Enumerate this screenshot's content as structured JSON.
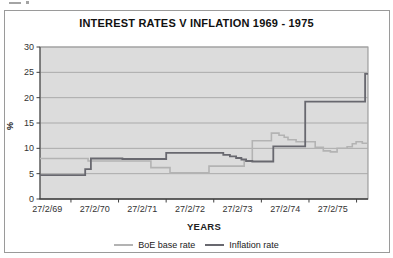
{
  "chart_data": {
    "type": "line",
    "title": "INTEREST RATES V INFLATION 1969 - 1975",
    "xlabel": "YEARS",
    "ylabel": "%",
    "x_tick_labels": [
      "27/2/69",
      "27/2/70",
      "27/2/71",
      "27/2/72",
      "27/2/73",
      "27/2/74",
      "27/2/75"
    ],
    "x_tick_years": [
      0,
      1,
      2,
      3,
      4,
      5,
      6
    ],
    "x_range_years": [
      -0.15,
      6.74
    ],
    "ylim": [
      0,
      30
    ],
    "y_ticks": [
      0,
      5,
      10,
      15,
      20,
      25,
      30
    ],
    "grid": true,
    "legend_position": "bottom-center",
    "plot_style": "stepped line, grey filled plot area",
    "colors": {
      "plot_bg": "#dcdcdc",
      "gridline": "#aaaaaa",
      "plot_border": "#8f8f8f",
      "axis": "#3f3f3f",
      "tick_text": "#333333",
      "title_text": "#111111"
    },
    "series": [
      {
        "name": "BoE base rate",
        "color": "#b3b3b3",
        "stroke_width": 1.6,
        "steps_years_percent": [
          [
            -0.15,
            8.0
          ],
          [
            0.86,
            7.5
          ],
          [
            2.18,
            6.2
          ],
          [
            2.58,
            5.2
          ],
          [
            3.4,
            6.5
          ],
          [
            4.14,
            7.5
          ],
          [
            4.31,
            11.5
          ],
          [
            4.71,
            13.0
          ],
          [
            4.87,
            12.6
          ],
          [
            4.98,
            12.2
          ],
          [
            5.06,
            11.7
          ],
          [
            5.23,
            11.3
          ],
          [
            5.63,
            10.2
          ],
          [
            5.8,
            9.5
          ],
          [
            5.95,
            9.3
          ],
          [
            6.09,
            10.0
          ],
          [
            6.3,
            10.3
          ],
          [
            6.41,
            10.9
          ],
          [
            6.49,
            11.3
          ],
          [
            6.62,
            11.0
          ]
        ]
      },
      {
        "name": "Inflation rate",
        "color": "#68686f",
        "stroke_width": 1.8,
        "steps_years_percent": [
          [
            -0.15,
            4.7
          ],
          [
            0.8,
            5.9
          ],
          [
            0.92,
            8.0
          ],
          [
            1.58,
            7.9
          ],
          [
            2.5,
            9.1
          ],
          [
            3.7,
            8.7
          ],
          [
            3.84,
            8.4
          ],
          [
            3.97,
            8.1
          ],
          [
            4.08,
            7.8
          ],
          [
            4.18,
            7.5
          ],
          [
            4.31,
            7.4
          ],
          [
            4.75,
            10.4
          ],
          [
            5.42,
            19.2
          ],
          [
            6.68,
            24.7
          ]
        ]
      }
    ]
  }
}
